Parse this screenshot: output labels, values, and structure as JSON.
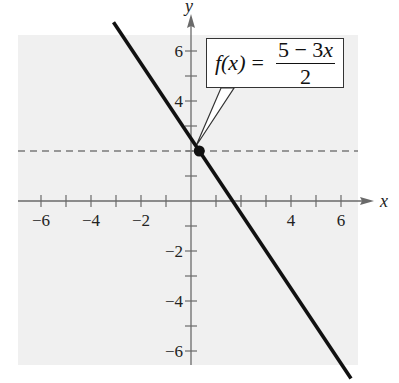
{
  "chart_data": {
    "type": "line",
    "title": "",
    "xlabel": "x",
    "ylabel": "y",
    "xlim": [
      -6.8,
      6.8
    ],
    "ylim": [
      -6.6,
      6.6
    ],
    "grid": false,
    "x_tick_labels": [
      "-6",
      "-4",
      "-2",
      "4",
      "6"
    ],
    "y_tick_labels": [
      "6",
      "4",
      "-2",
      "-4",
      "-6"
    ],
    "x_ticks": [
      -6,
      -5,
      -4,
      -3,
      -2,
      -1,
      1,
      2,
      3,
      4,
      5,
      6
    ],
    "y_ticks": [
      -6,
      -5,
      -4,
      -3,
      -2,
      -1,
      1,
      2,
      3,
      4,
      5,
      6
    ],
    "series": [
      {
        "name": "f(x) = (5 - 3x)/2",
        "style": "solid",
        "color": "#111111",
        "x": [
          -3.1,
          6.4
        ],
        "y": [
          7.15,
          -7.1
        ]
      },
      {
        "name": "y = 2",
        "style": "dashed",
        "color": "#777777",
        "x": [
          -6.8,
          6.8
        ],
        "y": [
          2,
          2
        ]
      }
    ],
    "points": [
      {
        "x": 0.33,
        "y": 2,
        "marker": "filled-circle"
      }
    ],
    "annotations": [
      {
        "text": "f(x) = (5 − 3x)/2",
        "type": "callout",
        "points_to": [
          0.2,
          2.3
        ]
      }
    ]
  },
  "callout": {
    "lhs": "f(x)",
    "eq": "=",
    "numerator_a": "5 − 3",
    "numerator_var": "x",
    "denominator": "2"
  },
  "axes": {
    "x_label": "x",
    "y_label": "y"
  },
  "colors": {
    "plot_bg": "#f0f0f0",
    "axis": "#6a6a6a",
    "line": "#111111",
    "dash": "#7a7a7a"
  }
}
